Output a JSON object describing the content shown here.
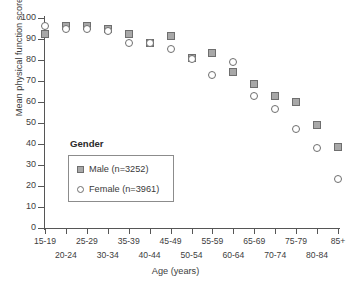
{
  "chart_data": {
    "type": "scatter",
    "title": "",
    "xlabel": "Age (years)",
    "ylabel": "Mean physical function score",
    "categories": [
      "15-19",
      "20-24",
      "25-29",
      "30-34",
      "35-39",
      "40-44",
      "45-49",
      "50-54",
      "55-59",
      "60-64",
      "65-69",
      "70-74",
      "75-79",
      "80-84",
      "85+"
    ],
    "ylim": [
      0,
      100
    ],
    "yticks": [
      0,
      10,
      20,
      30,
      40,
      50,
      60,
      70,
      80,
      90,
      100
    ],
    "grid": false,
    "legend_position": "inside-lower-left",
    "series": [
      {
        "name": "Male (n=3252)",
        "marker": "filled-square",
        "color": "#a8a8a8",
        "values": [
          92.5,
          96.0,
          96.0,
          95.0,
          92.5,
          88.0,
          91.5,
          81.0,
          83.5,
          74.5,
          68.5,
          63.0,
          60.0,
          49.0,
          38.5
        ]
      },
      {
        "name": "Female (n=3961)",
        "marker": "open-circle",
        "color": "#ffffff",
        "values": [
          96.0,
          95.0,
          95.0,
          94.0,
          88.0,
          88.0,
          85.5,
          80.5,
          73.0,
          79.0,
          63.0,
          56.5,
          47.0,
          38.0,
          23.5
        ]
      }
    ]
  },
  "legend": {
    "title": "Gender",
    "entries": [
      {
        "label": "Male (n=3252)"
      },
      {
        "label": "Female (n=3961)"
      }
    ]
  },
  "axes": {
    "y_title": "Mean physical function score",
    "x_title": "Age (years)",
    "y_tick_labels": [
      "100",
      "90",
      "80",
      "70",
      "60",
      "50",
      "40",
      "30",
      "20",
      "10",
      "0"
    ],
    "x_tick_labels": [
      "15-19",
      "20-24",
      "25-29",
      "30-34",
      "35-39",
      "40-44",
      "45-49",
      "50-54",
      "55-59",
      "60-64",
      "65-69",
      "70-74",
      "75-79",
      "80-84",
      "85+"
    ]
  }
}
